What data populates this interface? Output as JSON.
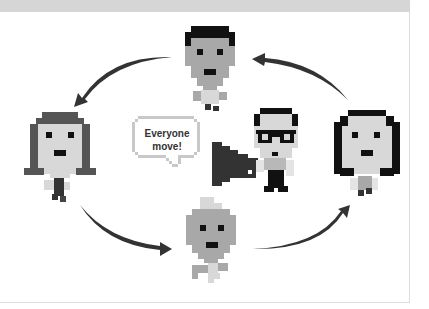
{
  "diagram": {
    "type": "cycle",
    "speech_bubble": {
      "line1": "Everyone",
      "line2": "move!"
    },
    "characters": [
      {
        "id": "top",
        "label": "top-character",
        "hair": "black",
        "face": "#a8a8a8"
      },
      {
        "id": "left",
        "label": "left-character",
        "hair": "dark-gray-long",
        "face": "#d8d8d8"
      },
      {
        "id": "right",
        "label": "right-character",
        "hair": "black-long",
        "face": "#d8d8d8"
      },
      {
        "id": "bottom",
        "label": "bottom-character",
        "hair": "light-gray",
        "face": "#a8a8a8"
      },
      {
        "id": "center",
        "label": "leader-with-megaphone",
        "hair": "black",
        "glasses": true,
        "face": "#d8d8d8"
      }
    ],
    "arrows": [
      {
        "from": "top",
        "to": "left"
      },
      {
        "from": "left",
        "to": "bottom"
      },
      {
        "from": "bottom",
        "to": "right"
      },
      {
        "from": "right",
        "to": "top"
      }
    ],
    "colors": {
      "arrow": "#333333",
      "dark": "#111111",
      "mid_gray": "#a8a8a8",
      "light_gray": "#d8d8d8",
      "band": "#d6d6d6"
    }
  }
}
